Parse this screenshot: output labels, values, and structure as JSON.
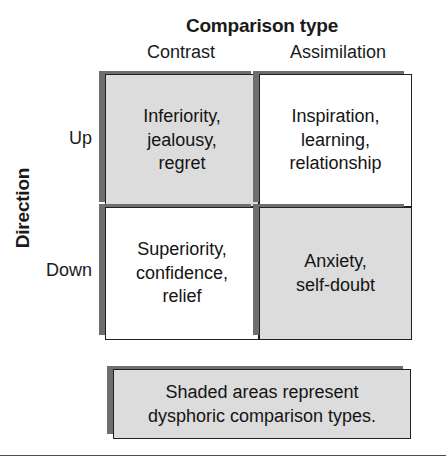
{
  "figure": {
    "title": "Comparison type",
    "column_axis_label": "Comparison type",
    "row_axis_label": "Direction",
    "columns": [
      {
        "key": "contrast",
        "label": "Contrast"
      },
      {
        "key": "assimilation",
        "label": "Assimilation"
      }
    ],
    "rows": [
      {
        "key": "up",
        "label": "Up"
      },
      {
        "key": "down",
        "label": "Down"
      }
    ],
    "cells": [
      {
        "row": "Up",
        "column": "Contrast",
        "text": "Inferiority,\njealousy,\nregret",
        "shaded": true
      },
      {
        "row": "Up",
        "column": "Assimilation",
        "text": "Inspiration,\nlearning,\nrelationship",
        "shaded": false
      },
      {
        "row": "Down",
        "column": "Contrast",
        "text": "Superiority,\nconfidence,\nrelief",
        "shaded": false
      },
      {
        "row": "Down",
        "column": "Assimilation",
        "text": "Anxiety,\nself-doubt",
        "shaded": true
      }
    ],
    "legend": {
      "text": "Shaded areas represent\ndysphoric comparison types."
    },
    "colors": {
      "shaded_fill": "#dcdcdc",
      "plain_fill": "#ffffff",
      "border": "#202020",
      "shadow": "#6e6e6e",
      "text": "#141414",
      "rule": "#4d4d4d"
    }
  }
}
